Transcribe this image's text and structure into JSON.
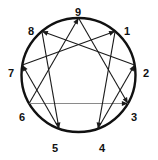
{
  "figure": {
    "width": 158,
    "height": 160,
    "background_color": "#ffffff"
  },
  "circle": {
    "center_x": 78.5,
    "center_y": 75,
    "radius": 57,
    "stroke_color": "#111111",
    "stroke_width": 2.4,
    "fill": "none"
  },
  "labels": [
    {
      "text": "9",
      "point": 9,
      "angle_deg": -90,
      "x": 78,
      "y": 12
    },
    {
      "text": "1",
      "point": 1,
      "angle_deg": -50,
      "x": 127,
      "y": 31
    },
    {
      "text": "2",
      "point": 2,
      "angle_deg": -10,
      "x": 146,
      "y": 73
    },
    {
      "text": "3",
      "point": 3,
      "angle_deg": 30,
      "x": 134,
      "y": 117
    },
    {
      "text": "4",
      "point": 4,
      "angle_deg": 70,
      "x": 102,
      "y": 148
    },
    {
      "text": "5",
      "point": 5,
      "angle_deg": 110,
      "x": 55,
      "y": 148
    },
    {
      "text": "6",
      "point": 6,
      "angle_deg": 150,
      "x": 22,
      "y": 117
    },
    {
      "text": "7",
      "point": 7,
      "angle_deg": 190,
      "x": 11,
      "y": 73
    },
    {
      "text": "8",
      "point": 8,
      "angle_deg": 230,
      "x": 31,
      "y": 31
    }
  ],
  "vertices": {
    "9": {
      "x": 78.5,
      "y": 18.0
    },
    "1": {
      "x": 115.1,
      "y": 31.3
    },
    "2": {
      "x": 134.6,
      "y": 65.1
    },
    "3": {
      "x": 127.9,
      "y": 103.5
    },
    "4": {
      "x": 98.0,
      "y": 128.6
    },
    "5": {
      "x": 59.0,
      "y": 128.6
    },
    "6": {
      "x": 29.1,
      "y": 103.5
    },
    "7": {
      "x": 22.4,
      "y": 65.1
    },
    "8": {
      "x": 41.9,
      "y": 31.3
    }
  },
  "triangle": {
    "name": "inner-triangle-9-3-6",
    "sequence": [
      9,
      3,
      6,
      9
    ],
    "edges": [
      {
        "from": 9,
        "to": 3,
        "color": "#1a1a1a",
        "arrow_at": "to"
      },
      {
        "from": 3,
        "to": 6,
        "color": "#8a8a8a",
        "arrow_at": "from"
      },
      {
        "from": 6,
        "to": 9,
        "color": "#1a1a1a",
        "arrow_at": "to"
      }
    ],
    "stroke_width": 1.1
  },
  "hexad": {
    "name": "hexad-1-4-2-8-5-7",
    "sequence": [
      1,
      4,
      2,
      8,
      5,
      7,
      1
    ],
    "edges": [
      {
        "from": 1,
        "to": 4,
        "color": "#1a1a1a",
        "arrow_at": "to"
      },
      {
        "from": 4,
        "to": 2,
        "color": "#1a1a1a",
        "arrow_at": "to"
      },
      {
        "from": 2,
        "to": 8,
        "color": "#1a1a1a",
        "arrow_at": "to"
      },
      {
        "from": 8,
        "to": 5,
        "color": "#1a1a1a",
        "arrow_at": "to"
      },
      {
        "from": 5,
        "to": 7,
        "color": "#1a1a1a",
        "arrow_at": "to"
      },
      {
        "from": 7,
        "to": 1,
        "color": "#1a1a1a",
        "arrow_at": "to"
      }
    ],
    "stroke_width": 1.1
  },
  "arrowhead": {
    "color": "#1a1a1a",
    "length": 6,
    "width": 5
  }
}
